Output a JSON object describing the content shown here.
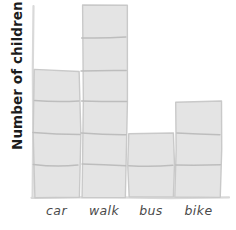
{
  "chart_data": {
    "type": "bar",
    "title": "",
    "xlabel": "",
    "ylabel": "Number of children",
    "categories": [
      "car",
      "walk",
      "bus",
      "bike"
    ],
    "values": [
      4,
      6,
      2,
      3
    ],
    "ylim": [
      0,
      6
    ],
    "grid": false,
    "legend": null,
    "style": "hand-drawn",
    "colors": {
      "bar_fill": "#e4e4e4",
      "bar_stroke": "#c9c9c9",
      "divider": "#bdbdbd",
      "axis": "#d9d9d9",
      "tick_label": "#4a4a4a",
      "axis_title": "#1c1c1c",
      "background": "#ffffff"
    }
  },
  "axes": {
    "y_title": "Number of children",
    "x_tick_labels": [
      "car",
      "walk",
      "bus",
      "bike"
    ]
  },
  "bars": [
    {
      "category": "car",
      "value": 4
    },
    {
      "category": "walk",
      "value": 6
    },
    {
      "category": "bus",
      "value": 2
    },
    {
      "category": "bike",
      "value": 3
    }
  ]
}
